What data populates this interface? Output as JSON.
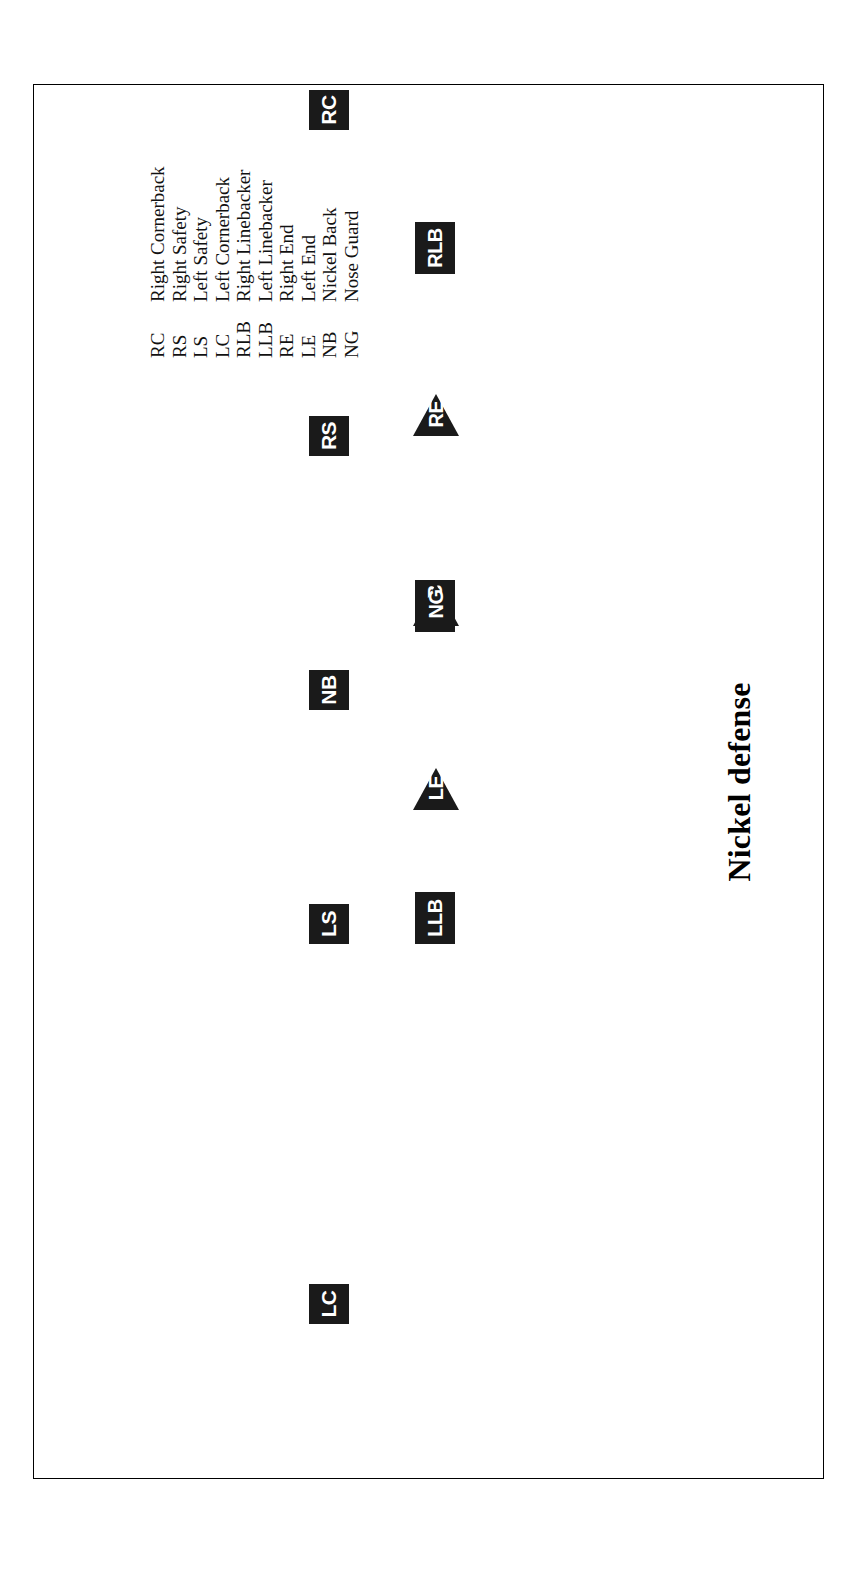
{
  "figure": {
    "title": "Nickel defense",
    "type": "american-football-formation-diagram",
    "orientation_deg": -90
  },
  "players": [
    {
      "abbr": "LC",
      "shape": "square",
      "x": 154,
      "y": 274
    },
    {
      "abbr": "LS",
      "shape": "square",
      "x": 534,
      "y": 274
    },
    {
      "abbr": "LLB",
      "shape": "square",
      "x": 534,
      "y": 380,
      "wide": true
    },
    {
      "abbr": "LE",
      "shape": "triangle",
      "x": 668,
      "y": 378
    },
    {
      "abbr": "NB",
      "shape": "square",
      "x": 768,
      "y": 274
    },
    {
      "abbr": "MLB",
      "shape": "square",
      "x": 846,
      "y": 380,
      "wide": true
    },
    {
      "abbr": "NG",
      "shape": "triangle",
      "x": 852,
      "y": 378
    },
    {
      "abbr": "RS",
      "shape": "square",
      "x": 1022,
      "y": 274
    },
    {
      "abbr": "RE",
      "shape": "triangle",
      "x": 1042,
      "y": 378
    },
    {
      "abbr": "RLB",
      "shape": "square",
      "x": 1204,
      "y": 380,
      "wide": true
    },
    {
      "abbr": "RC",
      "shape": "square",
      "x": 1348,
      "y": 274
    }
  ],
  "legend": {
    "rows": [
      {
        "abbr": "RC",
        "desc": "Right Cornerback"
      },
      {
        "abbr": "RS",
        "desc": "Right Safety"
      },
      {
        "abbr": "LS",
        "desc": "Left Safety"
      },
      {
        "abbr": "LC",
        "desc": "Left Cornerback"
      },
      {
        "abbr": "RLB",
        "desc": "Right Linebacker"
      },
      {
        "abbr": "LLB",
        "desc": "Left Linebacker"
      },
      {
        "abbr": "RE",
        "desc": "Right End"
      },
      {
        "abbr": "LE",
        "desc": "Left End"
      },
      {
        "abbr": "NB",
        "desc": "Nickel Back"
      },
      {
        "abbr": "NG",
        "desc": "Nose Guard"
      }
    ]
  },
  "colors": {
    "marker_fill": "#1a1a1a",
    "marker_text": "#ffffff",
    "page_background": "#ffffff",
    "frame_border": "#000000",
    "legend_text": "#111111"
  }
}
